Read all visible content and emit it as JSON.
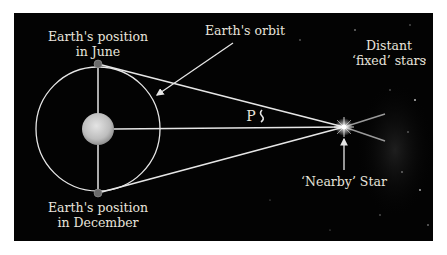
{
  "diagram": {
    "colors": {
      "background": "#030303",
      "page": "#ffffff",
      "lines": "#e6e6e6",
      "text": "#e8e4dc",
      "sun": "#cfcfcf",
      "earth": "#6b6b6b"
    },
    "labels": {
      "earth_june": {
        "line1": "Earth's position",
        "line2": "in June"
      },
      "earth_december": {
        "line1": "Earth's position",
        "line2": "in December"
      },
      "orbit": "Earth's orbit",
      "distant_stars": {
        "line1": "Distant",
        "line2": "‘fixed’ stars"
      },
      "nearby_star": "‘Nearby’ Star",
      "parallax_angle": "P"
    },
    "nodes": [
      {
        "id": "sun",
        "label": "",
        "x": 98,
        "y": 129,
        "r": 16
      },
      {
        "id": "earth-june",
        "label": "Earth's position in June",
        "x": 98,
        "y": 64,
        "r": 4
      },
      {
        "id": "earth-december",
        "label": "Earth's position in December",
        "x": 98,
        "y": 193,
        "r": 4
      },
      {
        "id": "nearby-star",
        "label": "'Nearby' Star",
        "x": 344,
        "y": 127
      }
    ],
    "edges": [
      {
        "from": "earth-june",
        "to": "nearby-star"
      },
      {
        "from": "earth-december",
        "to": "nearby-star"
      },
      {
        "from": "sun",
        "to": "nearby-star"
      },
      {
        "from": "earth-june",
        "to": "earth-december"
      }
    ]
  }
}
